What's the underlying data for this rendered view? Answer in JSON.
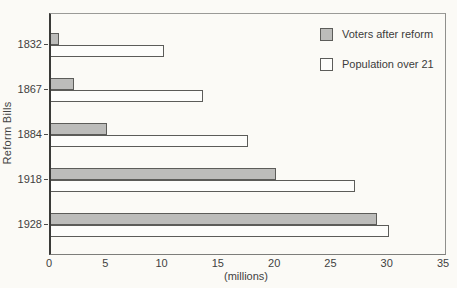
{
  "chart_data": {
    "type": "bar",
    "orientation": "horizontal",
    "title": "",
    "xlabel": "(millions)",
    "ylabel": "Reform Bills",
    "xlim": [
      0,
      35
    ],
    "xticks": [
      0,
      5,
      10,
      15,
      20,
      25,
      30,
      35
    ],
    "grid": false,
    "legend_position": "top-right-inside",
    "categories": [
      "1832",
      "1867",
      "1884",
      "1918",
      "1928"
    ],
    "series": [
      {
        "name": "Voters after reform",
        "color": "#bcbcba",
        "values": [
          0.7,
          2,
          5,
          20,
          29
        ]
      },
      {
        "name": "Population over 21",
        "color": "#fdfdfb",
        "values": [
          10,
          13.5,
          17.5,
          27,
          30
        ]
      }
    ]
  },
  "colors": {
    "background": "#fbfaf6",
    "bar_border": "#5c5c59",
    "axis": "#3a3a38",
    "frame": "#8f8f8c",
    "text": "#3c3c3c"
  }
}
